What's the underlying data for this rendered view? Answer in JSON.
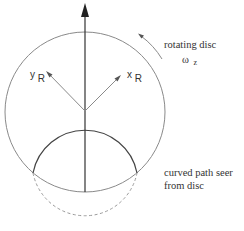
{
  "diagram": {
    "labels": {
      "rotating_disc": "rotating disc",
      "omega": "ω",
      "omega_sub": "z",
      "y_axis": "y",
      "y_axis_sub": "R",
      "x_axis": "x",
      "x_axis_sub": "R",
      "curved_path_line1": "curved path seer",
      "curved_path_line2": "from disc"
    },
    "colors": {
      "disc_outline": "#8a8a8a",
      "axis": "#333333",
      "rotating_axes": "#8a8a8a",
      "path_solid": "#444444",
      "path_dashed": "#9a9a9a"
    },
    "elements": [
      {
        "name": "rotating-disc",
        "shape": "circle",
        "cx": 85,
        "cy": 112,
        "r": 80
      },
      {
        "name": "vertical-straight-path",
        "shape": "arrow",
        "from": [
          85,
          192
        ],
        "to": [
          85,
          4
        ]
      },
      {
        "name": "x-r-axis",
        "shape": "arrow",
        "from": [
          85,
          111
        ],
        "to": [
          120,
          76
        ]
      },
      {
        "name": "y-r-axis",
        "shape": "arrow",
        "from": [
          85,
          111
        ],
        "to": [
          47,
          72
        ]
      },
      {
        "name": "curved-path-solid",
        "shape": "arc",
        "cx": 85,
        "cy": 175,
        "r": 53
      },
      {
        "name": "curved-path-dashed",
        "shape": "arc",
        "cx": 85,
        "cy": 175,
        "r": 53
      },
      {
        "name": "rotation-direction-arrow",
        "shape": "arc-arrow"
      }
    ]
  }
}
